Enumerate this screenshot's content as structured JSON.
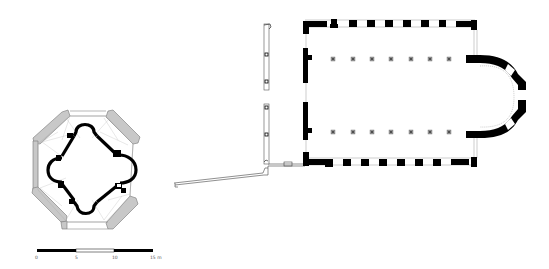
{
  "figure": {
    "type": "architectural-floor-plan",
    "colors": {
      "wall_solid": "#000000",
      "wall_restored": "#c8c8c8",
      "outline": "#555555",
      "thin_line": "#999999",
      "background": "#ffffff"
    }
  },
  "plans": {
    "octagon": {
      "label": "octagonal-baptistery-plan"
    },
    "basilica": {
      "label": "basilica-plan",
      "columns_per_row": 7,
      "rows": 2
    }
  },
  "scale_bar": {
    "ticks": [
      "0",
      "5",
      "10",
      "15 m"
    ],
    "unit": "m"
  }
}
